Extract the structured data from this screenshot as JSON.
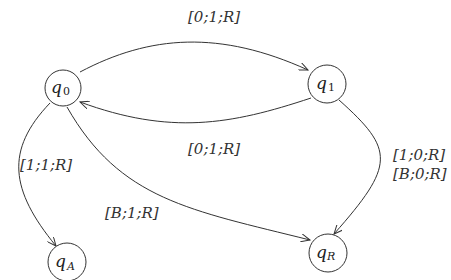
{
  "diagram": {
    "type": "state-machine",
    "states": [
      {
        "id": "q0",
        "base": "q",
        "sub": "0",
        "cx": 63,
        "cy": 88,
        "r": 18
      },
      {
        "id": "q1",
        "base": "q",
        "sub": "1",
        "cx": 327,
        "cy": 84,
        "r": 19
      },
      {
        "id": "qA",
        "base": "q",
        "sub": "A",
        "cx": 67,
        "cy": 262,
        "r": 19
      },
      {
        "id": "qR",
        "base": "q",
        "sub": "R",
        "cx": 328,
        "cy": 253,
        "r": 19
      }
    ],
    "transitions": [
      {
        "from": "q0",
        "to": "q1",
        "label": "[0;1;R]"
      },
      {
        "from": "q1",
        "to": "q0",
        "label": "[0;1;R]"
      },
      {
        "from": "q0",
        "to": "qA",
        "label": "[1;1;R]"
      },
      {
        "from": "q0",
        "to": "qR",
        "label": "[B;1;R]"
      },
      {
        "from": "q1",
        "to": "qR",
        "label_line1": "[1;0;R]",
        "label_line2": "[B;0;R]"
      }
    ]
  }
}
